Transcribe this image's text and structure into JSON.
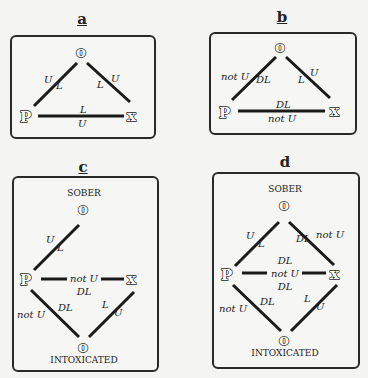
{
  "figure": {
    "top_clipped_label": "(b)",
    "panels": [
      {
        "id": "a",
        "label": "a",
        "nodes": {
          "o": "o",
          "p": "P",
          "x": "x"
        },
        "edges": {
          "p_o": {
            "upper": "U",
            "lower": "L"
          },
          "o_x": {
            "upper": "U",
            "lower": "L"
          },
          "p_x": {
            "upper": "L",
            "lower": "U"
          }
        }
      },
      {
        "id": "b",
        "label": "b",
        "nodes": {
          "o": "o",
          "p": "P",
          "x": "x"
        },
        "edges": {
          "p_o": {
            "upper": "not U",
            "lower": "DL"
          },
          "o_x": {
            "upper": "U",
            "lower": "L"
          },
          "p_x": {
            "upper": "DL",
            "lower": "not U"
          }
        }
      },
      {
        "id": "c",
        "label": "c",
        "states": {
          "top": "SOBER",
          "bottom": "INTOXICATED"
        },
        "nodes": {
          "o_top": "o",
          "p": "P",
          "x": "x",
          "o_bottom": "o"
        },
        "edges": {
          "p_otop": {
            "upper": "U",
            "lower": "L"
          },
          "p_x": {
            "middle": "not U",
            "lower": "DL"
          },
          "p_obottom": {
            "outer": "not U",
            "inner": "DL"
          },
          "x_obottom": {
            "inner": "L",
            "outer": "U"
          }
        }
      },
      {
        "id": "d",
        "label": "d",
        "states": {
          "top": "SOBER",
          "bottom": "INTOXICATED"
        },
        "nodes": {
          "o_top": "o",
          "p": "P",
          "x": "x",
          "o_bottom": "o"
        },
        "edges": {
          "p_otop": {
            "upper": "U",
            "lower": "L"
          },
          "otop_x": {
            "inner": "DL",
            "outer": "not U"
          },
          "p_x": {
            "upper": "DL",
            "middle": "not U",
            "lower": "DL"
          },
          "p_obottom": {
            "outer": "not U",
            "inner": "DL"
          },
          "x_obottom": {
            "inner": "L",
            "outer": "U"
          }
        }
      }
    ]
  }
}
